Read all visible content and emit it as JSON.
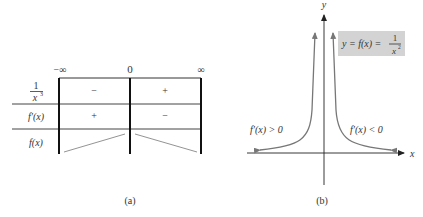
{
  "figure_a": {
    "caption": "(a)",
    "column_labels": [
      "−∞",
      "0",
      "∞"
    ],
    "rows": [
      {
        "label_num": "1",
        "label_den": "x",
        "label_den_exp": "3",
        "signs": [
          "−",
          "+"
        ]
      },
      {
        "label": "f′(x)",
        "signs": [
          "+",
          "−"
        ]
      },
      {
        "label": "f(x)",
        "trend": [
          "increasing",
          "decreasing"
        ]
      }
    ]
  },
  "figure_b": {
    "caption": "(b)",
    "axis_x_label": "x",
    "axis_y_label": "y",
    "equation_lhs": "y = f(x) =",
    "equation_num": "1",
    "equation_den": "x",
    "equation_den_exp": "2",
    "left_annotation": "f′(x) > 0",
    "right_annotation": "f′(x) < 0",
    "box_color": "#d3d3d3",
    "curve_color": "#777777"
  }
}
